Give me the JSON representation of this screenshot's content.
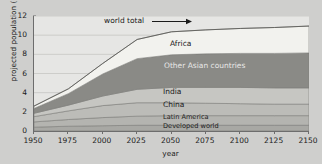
{
  "chart_data": {
    "type": "area",
    "title": "",
    "subtitle": "",
    "xlabel": "year",
    "ylabel": "projected population (10⁹)",
    "ylabel_base": "projected population (10",
    "ylabel_exp": "9",
    "ylabel_close": ")",
    "xlim": [
      1950,
      2150
    ],
    "ylim": [
      0,
      12
    ],
    "grid": true,
    "legend_position": "inline-labels",
    "stacked": true,
    "x": [
      1950,
      1975,
      2000,
      2025,
      2050,
      2075,
      2100,
      2125,
      2150
    ],
    "xticks": [
      "1950",
      "1975",
      "2000",
      "2025",
      "2050",
      "2075",
      "2100",
      "2125",
      "2150"
    ],
    "yticks": [
      "0",
      "2",
      "4",
      "6",
      "8",
      "10",
      "12"
    ],
    "series": [
      {
        "name": "Developed world",
        "color": "#a8a8a4",
        "label_color": "dark",
        "values": [
          0.4,
          0.5,
          0.55,
          0.6,
          0.6,
          0.6,
          0.6,
          0.6,
          0.6
        ]
      },
      {
        "name": "Latin America",
        "color": "#b4b4b0",
        "label_color": "dark",
        "values": [
          0.55,
          0.7,
          0.85,
          0.95,
          1.0,
          1.0,
          1.0,
          1.0,
          1.0
        ]
      },
      {
        "name": "China",
        "color": "#bcbcb8",
        "label_color": "dark",
        "values": [
          0.55,
          0.9,
          1.25,
          1.4,
          1.35,
          1.3,
          1.25,
          1.2,
          1.2
        ]
      },
      {
        "name": "India",
        "color": "#c6c6c2",
        "label_color": "dark",
        "values": [
          0.35,
          0.6,
          1.0,
          1.4,
          1.6,
          1.65,
          1.7,
          1.7,
          1.7
        ]
      },
      {
        "name": "Other Asian countries",
        "color": "#8a8a86",
        "label_color": "light",
        "values": [
          0.5,
          1.2,
          2.3,
          3.2,
          3.4,
          3.5,
          3.55,
          3.6,
          3.65
        ]
      },
      {
        "name": "Africa",
        "color": "#f2f2ee",
        "label_color": "dark",
        "values": [
          0.25,
          0.5,
          1.1,
          2.0,
          2.4,
          2.5,
          2.6,
          2.7,
          2.8
        ]
      }
    ],
    "totals": [
      2.5,
      4.4,
      7.05,
      9.55,
      10.35,
      10.55,
      10.7,
      10.8,
      10.95
    ],
    "annotations": [
      {
        "name": "world-total",
        "text": "world total",
        "arrow": true,
        "arrow_direction": "right",
        "points_to": "top boundary of stacked area"
      }
    ]
  },
  "band_labels": [
    {
      "name": "africa",
      "text": "Africa"
    },
    {
      "name": "other-asian-countries",
      "text": "Other Asian countries"
    },
    {
      "name": "india",
      "text": "India"
    },
    {
      "name": "china",
      "text": "China"
    },
    {
      "name": "latin-america",
      "text": "Latin America"
    },
    {
      "name": "developed-world",
      "text": "Developed world"
    }
  ],
  "colors": {
    "figure_background": "#cfcfcd",
    "plot_background": "#e6e6e4",
    "axis": "#6d6d6d",
    "text": "#1b1b1b",
    "gridline": "#c2c2be"
  }
}
